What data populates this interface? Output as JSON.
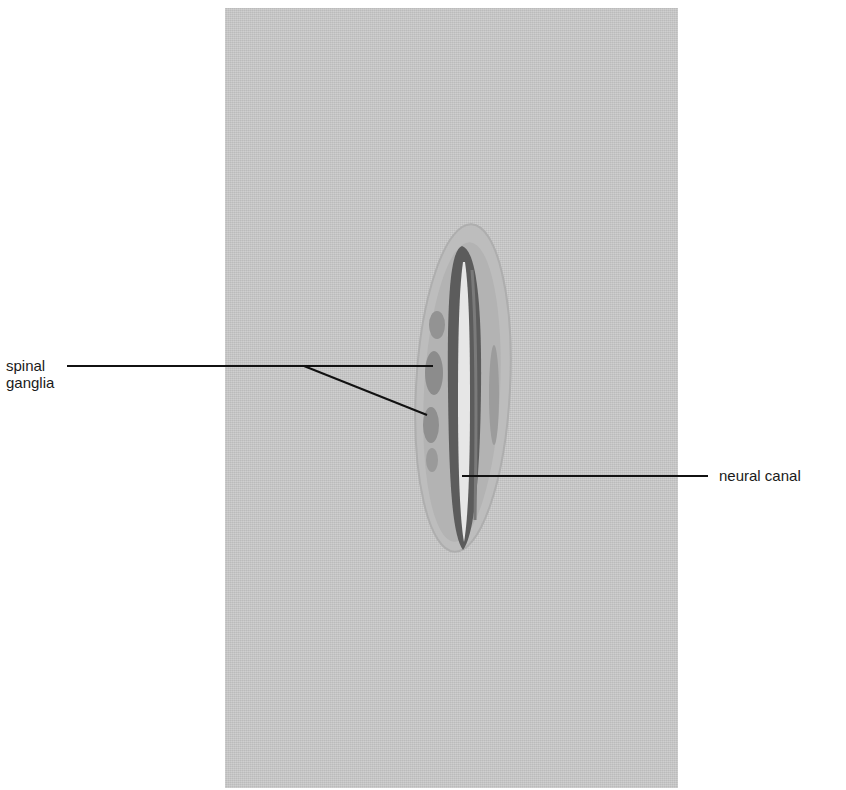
{
  "figure": {
    "panel": {
      "background": "#c9c9c9"
    },
    "labels": {
      "spinal_ganglia": {
        "line1": "spinal",
        "line2": "ganglia"
      },
      "neural_canal": "neural canal"
    },
    "colors": {
      "label_line": "#111111",
      "specimen_outer": "#b9b9b9",
      "specimen_tissue": "#a8a8a8",
      "neural_tube_wall": "#5f5f5f",
      "canal_lumen": "#e8e8e8",
      "ganglion": "#8a8a8a"
    }
  }
}
